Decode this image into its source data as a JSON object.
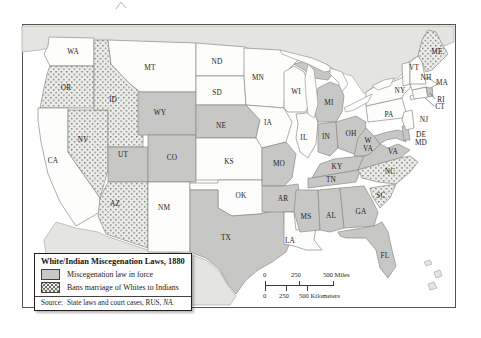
{
  "legend": {
    "title": "White/Indian Miscegenation Laws, 1880",
    "items": [
      {
        "category": "force",
        "label": "Miscegenation law in force"
      },
      {
        "category": "ban",
        "label": "Bans marriage of Whites to Indians"
      }
    ]
  },
  "source": {
    "prefix": "Source:",
    "text": "State laws and court cases, RUS, ",
    "emphasis": "NA."
  },
  "scalebar": {
    "miles_labels": [
      "0",
      "250",
      "500 Miles"
    ],
    "km_labels": [
      "0",
      "250",
      "500 Kilometers"
    ]
  },
  "colors": {
    "state_law_fill": "#c7c8c5",
    "state_none_fill": "#fdfdfb",
    "ban_pattern_bg": "#ebebe8",
    "ban_pattern_dot": "#6c6c69",
    "neighbor_fill": "#e4e4e0",
    "neighbor_stroke": "#a0a09b",
    "state_stroke": "#8b8b86",
    "water_fill": "#fdfdfb",
    "frame_stroke": "#56524e",
    "leader": "#4a4a46",
    "text": "#1c1c1c"
  },
  "map": {
    "neighbors": [
      {
        "name": "canada",
        "points": "22,26 454,26 454,42 444,46 434,34 424,36 418,56 408,62 404,72 398,78 386,82 372,88 364,94 352,76 338,72 326,64 310,58 294,62 282,52 262,52 246,48 196,46 140,44 94,42 58,46 40,50 22,52"
      },
      {
        "name": "mexico",
        "points": "56,222 76,228 98,232 106,236 148,250 190,254 206,260 220,272 228,286 236,296 230,305 60,305 48,268 44,240"
      }
    ],
    "states": [
      {
        "name": "wa",
        "abbr": "WA",
        "category": "none",
        "points": "49,37 94,38 94,66 50,66 44,54 48,46"
      },
      {
        "name": "or",
        "abbr": "OR",
        "category": "ban",
        "points": "50,66 94,66 94,108 40,108 44,88 47,74"
      },
      {
        "name": "ca",
        "abbr": "CA",
        "category": "none",
        "points": "38,108 68,108 68,152 100,198 100,212 76,226 60,202 48,174 41,142 38,120"
      },
      {
        "name": "nv",
        "abbr": "NV",
        "category": "ban",
        "points": "68,110 108,110 108,170 100,198 68,152"
      },
      {
        "name": "id",
        "abbr": "ID",
        "category": "ban",
        "points": "94,40 108,40 111,64 128,82 140,92 140,135 143,135 143,147 108,147 108,110 94,110"
      },
      {
        "name": "mt",
        "abbr": "MT",
        "category": "none",
        "points": "108,40 196,43 196,92 140,92 128,82 111,64"
      },
      {
        "name": "wy",
        "abbr": "WY",
        "category": "force",
        "points": "138,92 196,92 196,135 138,135"
      },
      {
        "name": "ut",
        "abbr": "UT",
        "category": "force",
        "points": "108,147 148,147 148,182 108,182"
      },
      {
        "name": "co",
        "abbr": "CO",
        "category": "force",
        "points": "148,135 196,135 196,182 148,182"
      },
      {
        "name": "az",
        "abbr": "AZ",
        "category": "ban",
        "points": "108,182 148,182 148,248 106,234 98,216 100,198 104,190"
      },
      {
        "name": "nm",
        "abbr": "NM",
        "category": "none",
        "points": "148,182 190,182 190,252 148,252"
      },
      {
        "name": "nd",
        "abbr": "ND",
        "category": "none",
        "points": "196,43 246,47 244,76 196,76"
      },
      {
        "name": "sd",
        "abbr": "SD",
        "category": "none",
        "points": "196,76 244,76 246,105 196,105"
      },
      {
        "name": "ne",
        "abbr": "NE",
        "category": "force",
        "points": "196,105 246,105 260,120 256,138 196,138"
      },
      {
        "name": "ks",
        "abbr": "KS",
        "category": "none",
        "points": "196,138 256,138 262,146 262,180 196,180"
      },
      {
        "name": "ok",
        "abbr": "OK",
        "category": "none",
        "points": "190,183 218,183 218,180 262,180 262,186 284,186 284,208 260,214 232,216 218,208 218,190 190,190"
      },
      {
        "name": "tx",
        "abbr": "TX",
        "category": "force",
        "points": "190,190 218,190 218,208 232,216 260,214 284,208 284,224 292,238 286,252 272,262 258,270 246,280 236,294 228,284 220,270 206,258 190,252"
      },
      {
        "name": "mn",
        "abbr": "MN",
        "category": "none",
        "points": "244,48 280,50 298,60 286,72 284,108 246,105 244,76"
      },
      {
        "name": "ia",
        "abbr": "IA",
        "category": "none",
        "points": "246,105 284,108 292,122 286,142 262,148 256,138 260,120"
      },
      {
        "name": "mo",
        "abbr": "MO",
        "category": "force",
        "points": "262,148 286,142 296,154 292,178 284,186 262,186"
      },
      {
        "name": "ar",
        "abbr": "AR",
        "category": "force",
        "points": "262,186 284,186 298,184 300,196 294,212 262,212"
      },
      {
        "name": "la",
        "abbr": "LA",
        "category": "none",
        "points": "284,212 294,212 296,230 316,228 314,240 322,250 306,250 294,246 284,244"
      },
      {
        "name": "wi",
        "abbr": "WI",
        "category": "none",
        "points": "284,72 294,66 304,72 308,82 310,100 306,112 288,112 284,108"
      },
      {
        "name": "il",
        "abbr": "IL",
        "category": "none",
        "points": "296,114 316,112 318,124 316,144 308,158 300,152 296,138 298,124"
      },
      {
        "name": "mi-up",
        "abbr": "MI",
        "category": "force",
        "points": "294,64 310,60 324,66 334,72 328,80 314,78 304,70"
      },
      {
        "name": "mi",
        "abbr": "MI",
        "category": "force",
        "points": "318,88 330,82 340,86 344,96 342,112 336,122 318,122 314,112 316,100"
      },
      {
        "name": "in",
        "abbr": "IN",
        "category": "force",
        "points": "318,124 336,122 338,148 330,156 318,152"
      },
      {
        "name": "oh",
        "abbr": "OH",
        "category": "force",
        "points": "336,122 356,116 366,122 364,142 354,154 338,148"
      },
      {
        "name": "ky",
        "abbr": "KY",
        "category": "force",
        "points": "312,178 320,164 334,159 352,157 364,156 358,170"
      },
      {
        "name": "tn",
        "abbr": "TN",
        "category": "force",
        "points": "308,178 312,178 358,170 362,166 356,182 308,188"
      },
      {
        "name": "ms",
        "abbr": "MS",
        "category": "force",
        "points": "296,190 318,190 320,230 300,232 294,212"
      },
      {
        "name": "al",
        "abbr": "AL",
        "category": "force",
        "points": "318,190 340,188 344,228 330,232 320,230"
      },
      {
        "name": "ga",
        "abbr": "GA",
        "category": "force",
        "points": "340,188 364,186 372,200 378,212 374,226 344,228"
      },
      {
        "name": "fl",
        "abbr": "FL",
        "category": "force",
        "points": "338,232 374,226 382,222 388,232 392,250 396,266 388,278 380,268 376,250 366,238 346,238 340,236"
      },
      {
        "name": "wv",
        "abbr": "WV",
        "category": "force",
        "points": "354,156 358,138 366,128 374,136 380,144 370,154 364,156"
      },
      {
        "name": "va",
        "abbr": "VA",
        "category": "force",
        "points": "358,170 364,156 370,154 380,144 388,148 398,144 410,150 400,158 378,164"
      },
      {
        "name": "nc",
        "abbr": "NC",
        "category": "ban",
        "points": "358,170 378,164 400,158 410,156 418,162 410,172 396,184 378,182 362,178"
      },
      {
        "name": "sc",
        "abbr": "SC",
        "category": "ban",
        "points": "370,188 396,184 390,198 380,208 372,196"
      },
      {
        "name": "md",
        "abbr": "MD",
        "category": "force",
        "points": "374,136 388,132 398,130 404,132 406,142 396,138 386,140 380,144"
      },
      {
        "name": "de",
        "abbr": "DE",
        "category": "force",
        "points": "402,126 408,126 410,140 404,140"
      },
      {
        "name": "pa",
        "abbr": "PA",
        "category": "none",
        "points": "366,106 402,98 406,112 402,118 368,122"
      },
      {
        "name": "nj",
        "abbr": "NJ",
        "category": "none",
        "points": "404,112 412,110 414,128 406,130 402,120"
      },
      {
        "name": "ny",
        "abbr": "NY",
        "category": "none",
        "points": "366,106 366,92 376,86 392,82 402,78 406,70 412,72 410,88 404,94 402,98"
      },
      {
        "name": "ny-long-island",
        "abbr": "NY",
        "category": "none",
        "points": "410,96 424,92 425,95 411,100"
      },
      {
        "name": "ct",
        "abbr": "CT",
        "category": "none",
        "points": "412,90 426,87 428,97 414,99"
      },
      {
        "name": "ri",
        "abbr": "RI",
        "category": "force",
        "points": "426,87 432,86 433,96 428,97"
      },
      {
        "name": "ma",
        "abbr": "MA",
        "category": "none",
        "points": "410,84 428,78 438,84 430,88 426,87 412,90"
      },
      {
        "name": "vt",
        "abbr": "VT",
        "category": "none",
        "points": "402,64 410,62 410,84 403,86"
      },
      {
        "name": "nh",
        "abbr": "NH",
        "category": "none",
        "points": "410,62 418,56 422,60 426,84 410,84"
      },
      {
        "name": "me",
        "abbr": "ME",
        "category": "ban",
        "points": "418,56 422,40 428,30 436,32 442,44 448,54 440,62 432,70 426,72 422,62"
      }
    ],
    "lakes": [
      {
        "name": "superior",
        "points": "280,50 296,54 312,58 326,64 334,70 324,72 308,64 292,58 282,54"
      },
      {
        "name": "michigan",
        "points": "308,64 314,70 316,86 318,104 314,118 308,114 306,96 305,78"
      },
      {
        "name": "huron",
        "points": "330,68 342,72 348,84 342,92 338,82 330,74"
      },
      {
        "name": "erie",
        "points": "344,108 356,102 368,96 372,94 368,102 354,110 346,112"
      },
      {
        "name": "ontario",
        "points": "372,86 384,80 394,78 390,86 378,90"
      }
    ],
    "islands": [
      "424,262 430,260 432,264 426,266",
      "434,272 440,270 442,276 436,278",
      "428,284 434,282 437,288 430,290"
    ],
    "leaders": [
      {
        "x1": 435,
        "y1": 99,
        "x2": 430,
        "y2": 93
      },
      {
        "x1": 434,
        "y1": 106,
        "x2": 425,
        "y2": 98
      }
    ],
    "labels": [
      {
        "text": "WA",
        "x": 73,
        "y": 54
      },
      {
        "text": "OR",
        "x": 66,
        "y": 90
      },
      {
        "text": "CA",
        "x": 53,
        "y": 163
      },
      {
        "text": "NV",
        "x": 83,
        "y": 142
      },
      {
        "text": "ID",
        "x": 113,
        "y": 102
      },
      {
        "text": "MT",
        "x": 150,
        "y": 70
      },
      {
        "text": "WY",
        "x": 160,
        "y": 115
      },
      {
        "text": "UT",
        "x": 123,
        "y": 157
      },
      {
        "text": "CO",
        "x": 172,
        "y": 160
      },
      {
        "text": "AZ",
        "x": 115,
        "y": 206
      },
      {
        "text": "NM",
        "x": 164,
        "y": 210
      },
      {
        "text": "ND",
        "x": 217,
        "y": 64
      },
      {
        "text": "SD",
        "x": 217,
        "y": 95
      },
      {
        "text": "NE",
        "x": 221,
        "y": 128
      },
      {
        "text": "KS",
        "x": 229,
        "y": 164
      },
      {
        "text": "OK",
        "x": 241,
        "y": 198
      },
      {
        "text": "TX",
        "x": 226,
        "y": 240
      },
      {
        "text": "MN",
        "x": 258,
        "y": 80
      },
      {
        "text": "IA",
        "x": 268,
        "y": 125
      },
      {
        "text": "MO",
        "x": 279,
        "y": 166
      },
      {
        "text": "AR",
        "x": 283,
        "y": 201
      },
      {
        "text": "LA",
        "x": 290,
        "y": 243
      },
      {
        "text": "WI",
        "x": 296,
        "y": 94
      },
      {
        "text": "IL",
        "x": 304,
        "y": 140
      },
      {
        "text": "MI",
        "x": 329,
        "y": 105
      },
      {
        "text": "IN",
        "x": 326,
        "y": 139
      },
      {
        "text": "OH",
        "x": 351,
        "y": 136
      },
      {
        "text": "KY",
        "x": 337,
        "y": 169
      },
      {
        "text": "TN",
        "x": 331,
        "y": 182
      },
      {
        "text": "MS",
        "x": 306,
        "y": 219
      },
      {
        "text": "AL",
        "x": 331,
        "y": 218
      },
      {
        "text": "GA",
        "x": 361,
        "y": 214
      },
      {
        "text": "FL",
        "x": 385,
        "y": 258
      },
      {
        "text": "W",
        "x": 368,
        "y": 143
      },
      {
        "text": "VA",
        "x": 368,
        "y": 151
      },
      {
        "text": "VA",
        "x": 393,
        "y": 154
      },
      {
        "text": "NC",
        "x": 390,
        "y": 174
      },
      {
        "text": "SC",
        "x": 381,
        "y": 198
      },
      {
        "text": "NY",
        "x": 400,
        "y": 93
      },
      {
        "text": "PA",
        "x": 389,
        "y": 117
      },
      {
        "text": "VT",
        "x": 414,
        "y": 70
      },
      {
        "text": "NH",
        "x": 426,
        "y": 80
      },
      {
        "text": "MA",
        "x": 442,
        "y": 85
      },
      {
        "text": "RI",
        "x": 441,
        "y": 102
      },
      {
        "text": "CT",
        "x": 440,
        "y": 109
      },
      {
        "text": "NJ",
        "x": 424,
        "y": 122
      },
      {
        "text": "DE",
        "x": 421,
        "y": 137
      },
      {
        "text": "MD",
        "x": 421,
        "y": 145
      },
      {
        "text": "ME",
        "x": 437,
        "y": 54
      }
    ]
  }
}
